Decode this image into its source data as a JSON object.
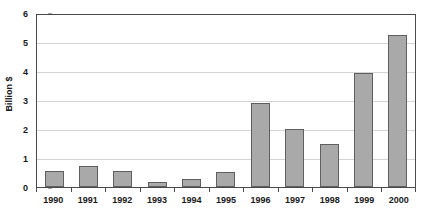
{
  "chart_data": {
    "type": "bar",
    "title": "",
    "subtitle": "",
    "xlabel": "",
    "ylabel": "Billion $",
    "categories": [
      "1990",
      "1991",
      "1992",
      "1993",
      "1994",
      "1995",
      "1996",
      "1997",
      "1998",
      "1999",
      "2000"
    ],
    "values": [
      0.56,
      0.73,
      0.55,
      0.18,
      0.28,
      0.52,
      2.9,
      2.0,
      1.5,
      3.93,
      5.25
    ],
    "ylim": [
      0,
      6
    ],
    "y_ticks": [
      "0",
      "1",
      "2",
      "3",
      "4",
      "5",
      "6"
    ],
    "y_tick_values": [
      0,
      1,
      2,
      3,
      4,
      5,
      6
    ],
    "grid": true,
    "grid_axis": "y",
    "legend": false,
    "legend_position": "none",
    "colors": {
      "bar_fill": "#a9a9a9",
      "bar_border": "#5f5f5f",
      "gridline": "#d4d4d4",
      "axis": "#4a4a4a",
      "text": "#1a1a1a",
      "background": "#ffffff"
    }
  }
}
